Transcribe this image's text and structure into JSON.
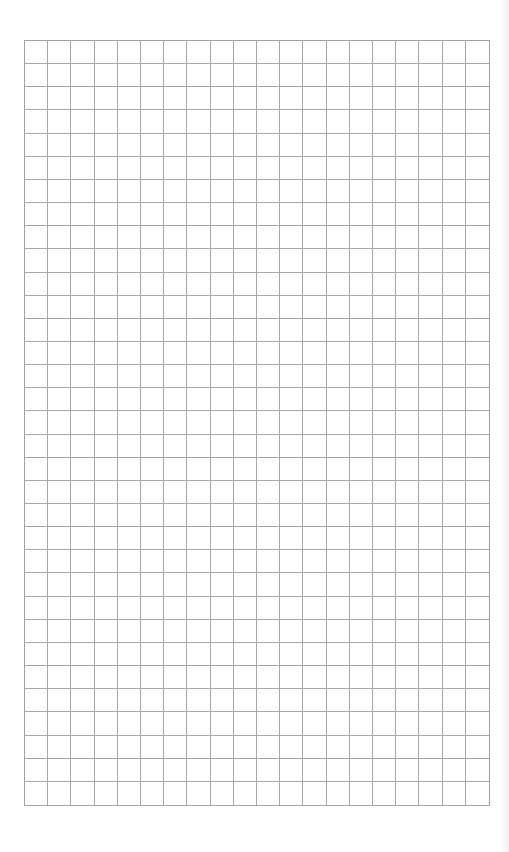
{
  "page": {
    "type": "graph-paper",
    "grid": {
      "columns": 20,
      "rows": 33,
      "line_color": "#a8a8a8",
      "background": "#ffffff"
    }
  }
}
